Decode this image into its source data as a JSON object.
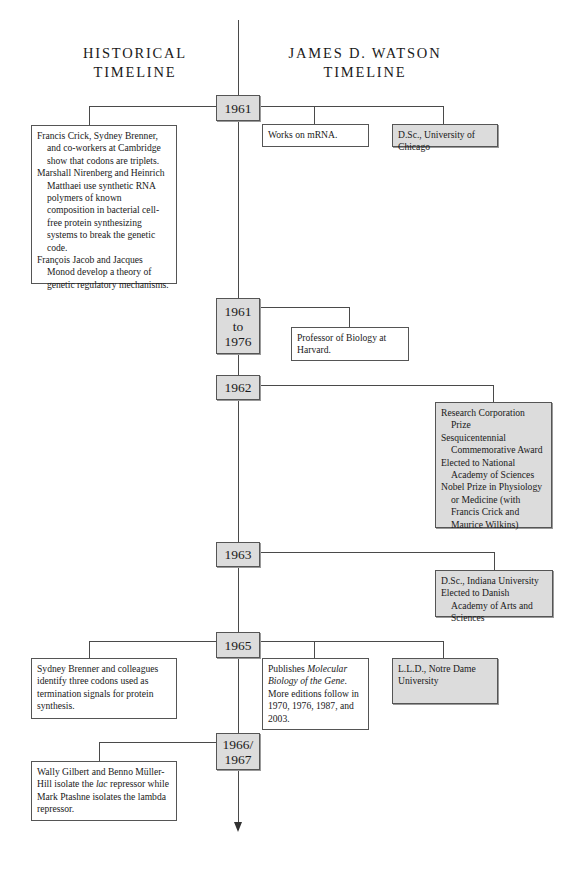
{
  "headers": {
    "left": [
      "HISTORICAL",
      "TIMELINE"
    ],
    "right": [
      "JAMES D. WATSON",
      "TIMELINE"
    ]
  },
  "years": [
    {
      "id": "1961",
      "label": [
        "1961"
      ]
    },
    {
      "id": "1961-1976",
      "label": [
        "1961",
        "to",
        "1976"
      ]
    },
    {
      "id": "1962",
      "label": [
        "1962"
      ]
    },
    {
      "id": "1963",
      "label": [
        "1963"
      ]
    },
    {
      "id": "1965",
      "label": [
        "1965"
      ]
    },
    {
      "id": "1966-1967",
      "label": [
        "1966/",
        "1967"
      ]
    }
  ],
  "historical": {
    "y1961": [
      "Francis Crick, Sydney Brenner, and co-workers at Cambridge show that codons are triplets.",
      "Marshall Nirenberg and Heinrich Matthaei use synthetic RNA polymers of known composition in bacterial cell-free protein synthesizing systems to break the genetic code.",
      "François Jacob and Jacques Monod develop a theory of genetic regulatory mechanisms."
    ],
    "y1965": [
      "Sydney Brenner and colleagues identify three codons used as termination signals for protein synthesis."
    ],
    "y1966": {
      "before_italic": "Wally Gilbert and Benno Müller-Hill isolate the ",
      "italic": "lac",
      "after_italic": " repressor while Mark Ptashne isolates the lambda repressor."
    }
  },
  "watson": {
    "y1961_work": "Works on mRNA.",
    "y1961_award": "D.Sc., University of Chicago",
    "y1961_1976": "Professor of Biology at Harvard.",
    "y1962": [
      "Research Corporation Prize",
      "Sesquicentennial Commemorative Award",
      "Elected to National Academy of Sciences",
      "Nobel Prize in Physiology or Medicine (with Francis Crick and Maurice Wilkins)"
    ],
    "y1963": [
      "D.Sc., Indiana University",
      "Elected to Danish Academy of Arts and Sciences"
    ],
    "y1965_work": {
      "before_italic": "Publishes ",
      "italic": "Molecular Biology of the Gene",
      "after_italic": ". More editions follow in 1970, 1976, 1987, and 2003."
    },
    "y1965_award": "L.L.D., Notre Dame University"
  }
}
